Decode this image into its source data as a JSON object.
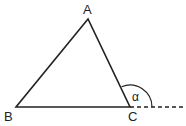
{
  "diagram": {
    "labels": {
      "A": "A",
      "B": "B",
      "C": "C",
      "alpha": "α"
    },
    "colors": {
      "stroke": "#222222"
    }
  }
}
